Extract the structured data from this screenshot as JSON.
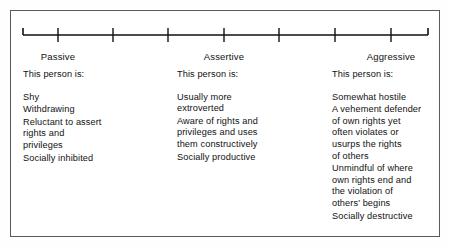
{
  "figure": {
    "border_color": "#5a5a5a",
    "text_color": "#111111",
    "background": "#ffffff"
  },
  "scale": {
    "name": "passive-assertive-aggressive-continuum",
    "tick_count": 7,
    "labels": [
      {
        "text": "Passive",
        "tick_index": 0,
        "x_percent": 10.9
      },
      {
        "text": "Assertive",
        "tick_index": 3,
        "x_percent": 49.5
      },
      {
        "text": "Aggressive",
        "tick_index": 6,
        "x_percent": 88.3
      }
    ]
  },
  "columns": [
    {
      "key": "passive",
      "heading": "This person is:",
      "groups": [
        {
          "lines": [
            "Shy"
          ]
        },
        {
          "lines": [
            "Withdrawing"
          ]
        },
        {
          "lines": [
            "Reluctant to assert",
            "rights and",
            "privileges"
          ]
        },
        {
          "lines": [
            "Socially inhibited"
          ]
        }
      ]
    },
    {
      "key": "assertive",
      "heading": "This person is:",
      "groups": [
        {
          "lines": [
            "Usually more",
            "extroverted"
          ]
        },
        {
          "lines": [
            "Aware of rights and",
            "privileges and uses",
            "them constructively"
          ]
        },
        {
          "lines": [
            "Socially productive"
          ]
        }
      ]
    },
    {
      "key": "aggressive",
      "heading": "This person is:",
      "groups": [
        {
          "lines": [
            "Somewhat hostile"
          ]
        },
        {
          "lines": [
            "A vehement defender",
            "of own rights yet",
            "often violates or",
            "usurps the rights",
            "of others"
          ]
        },
        {
          "lines": [
            "Unmindful of where",
            "own rights end and",
            "the violation of",
            "others' begins"
          ]
        },
        {
          "lines": [
            "Socially destructive"
          ]
        }
      ]
    }
  ]
}
